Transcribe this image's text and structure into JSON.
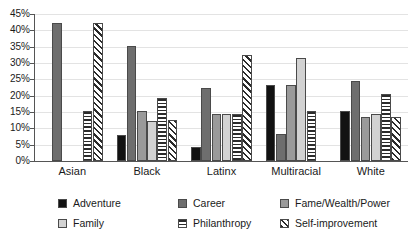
{
  "chart_data": {
    "type": "bar",
    "title": "",
    "subtitle": "",
    "xlabel": "",
    "ylabel": "",
    "ylim": [
      0,
      45
    ],
    "grid": true,
    "legend_position": "bottom",
    "categories": [
      "Asian",
      "Black",
      "Latinx",
      "Multiracial",
      "White"
    ],
    "ytick_labels": [
      "0%",
      "5%",
      "10%",
      "15%",
      "20%",
      "25%",
      "30%",
      "35%",
      "40%",
      "45%"
    ],
    "ytick_values": [
      0,
      5,
      10,
      15,
      20,
      25,
      30,
      35,
      40,
      45
    ],
    "series": [
      {
        "name": "Adventure",
        "color": "#121212",
        "pattern": "solid",
        "values": [
          0,
          8.1,
          4.4,
          23.4,
          15.4
        ]
      },
      {
        "name": "Career",
        "color": "#6e6e6e",
        "pattern": "solid",
        "values": [
          42.1,
          35.2,
          22.3,
          8.4,
          24.6
        ]
      },
      {
        "name": "Fame/Wealth/Power",
        "color": "#9a9a9a",
        "pattern": "solid",
        "values": [
          0,
          15.2,
          14.3,
          23.4,
          13.4
        ]
      },
      {
        "name": "Family",
        "color": "#d2d2d2",
        "pattern": "solid",
        "values": [
          0,
          12.2,
          14.3,
          31.4,
          14.5
        ]
      },
      {
        "name": "Philanthropy",
        "color": "#2b2b2b",
        "pattern": "horizontal-stripes",
        "values": [
          15.4,
          19.4,
          14.3,
          15.4,
          20.5
        ]
      },
      {
        "name": "Self-improvement",
        "color": "#2b2b2b",
        "pattern": "diagonal-stripes",
        "values": [
          42.2,
          12.6,
          32.4,
          0,
          13.6
        ]
      }
    ]
  },
  "legend": {
    "items": [
      {
        "label": "Adventure",
        "swatch": "adventure-swatch"
      },
      {
        "label": "Career",
        "swatch": "career-swatch"
      },
      {
        "label": "Fame/Wealth/Power",
        "swatch": "fame-swatch"
      },
      {
        "label": "Family",
        "swatch": "family-swatch"
      },
      {
        "label": "Philanthropy",
        "swatch": "philanthropy-swatch"
      },
      {
        "label": "Self-improvement",
        "swatch": "self-improvement-swatch"
      }
    ]
  }
}
